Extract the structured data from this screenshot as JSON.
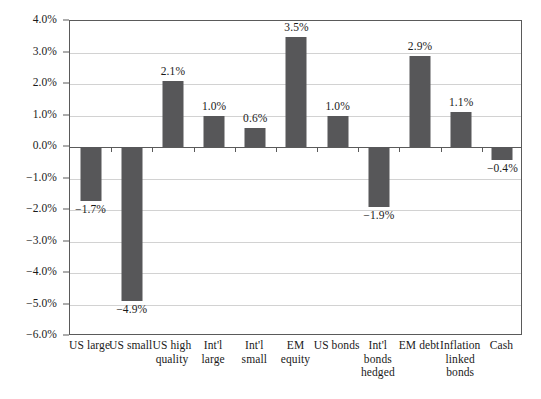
{
  "chart_data": {
    "type": "bar",
    "title": "",
    "subtitle": "",
    "xlabel": "",
    "ylabel": "",
    "ylim": [
      -6.0,
      4.0
    ],
    "ytick_step": 1.0,
    "ytick_labels": [
      "4.0%",
      "3.0%",
      "2.0%",
      "1.0%",
      "0.0%",
      "−1.0%",
      "−2.0%",
      "−3.0%",
      "−4.0%",
      "−5.0%",
      "−6.0%"
    ],
    "ytick_values": [
      4.0,
      3.0,
      2.0,
      1.0,
      0.0,
      -1.0,
      -2.0,
      -3.0,
      -4.0,
      -5.0,
      -6.0
    ],
    "grid": true,
    "grid_axis": "y",
    "legend": false,
    "legend_position": "none",
    "value_labels": true,
    "categories": [
      "US large",
      "US small",
      "US high\nquality",
      "Int'l\nlarge",
      "Int'l\nsmall",
      "EM\nequity",
      "US bonds",
      "Int'l\nbonds\nhedged",
      "EM debt",
      "Inflation\nlinked\nbonds",
      "Cash"
    ],
    "values": [
      -1.7,
      -4.9,
      2.1,
      1.0,
      0.6,
      3.5,
      1.0,
      -1.9,
      2.9,
      1.1,
      -0.4
    ],
    "data_labels": [
      "−1.7%",
      "−4.9%",
      "2.1%",
      "1.0%",
      "0.6%",
      "3.5%",
      "1.0%",
      "−1.9%",
      "2.9%",
      "1.1%",
      "−0.4%"
    ],
    "bar_color": "#575759",
    "grid_color": "#d2d2d2",
    "axis_color": "#5a5a5a",
    "background_color": "#ffffff"
  }
}
